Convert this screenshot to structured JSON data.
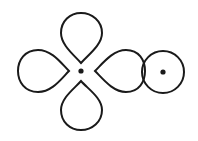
{
  "diagram": {
    "stroke_color": "#1a1a1a",
    "background": "#ffffff",
    "d_orbital": {
      "center": [
        81,
        71
      ],
      "lobes": [
        "top",
        "left",
        "right",
        "bottom"
      ]
    },
    "s_orbital": {
      "center": [
        163,
        72
      ],
      "radius": 20
    }
  }
}
